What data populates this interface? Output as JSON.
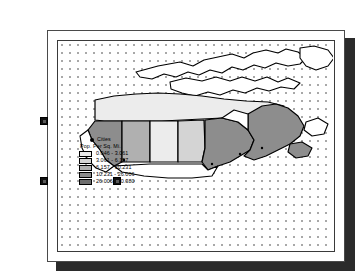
{
  "document": {
    "title": "",
    "type": "map-layout-page"
  },
  "canvas": {
    "grid": "dotted",
    "grid_spacing_px": 8,
    "grid_dot_color": "#a8a8a8",
    "background": "#ffffff"
  },
  "map": {
    "name": "canada-population-density",
    "region": "Canada and northern United States",
    "outline_color": "#000000",
    "fills": {
      "class1": "#ececec",
      "class2": "#d4d4d4",
      "class3": "#b0b0b0",
      "class4": "#8d8d8d",
      "class5": "#6e6e6e",
      "unclassed": "#ffffff"
    },
    "regions": [
      {
        "name": "northern-territories",
        "class": "class1"
      },
      {
        "name": "british-columbia",
        "class": "class4"
      },
      {
        "name": "alberta",
        "class": "class3"
      },
      {
        "name": "saskatchewan",
        "class": "class1"
      },
      {
        "name": "manitoba",
        "class": "class2"
      },
      {
        "name": "ontario",
        "class": "class4"
      },
      {
        "name": "quebec",
        "class": "class4"
      },
      {
        "name": "arctic-islands",
        "class": "unclassed"
      }
    ]
  },
  "legend": {
    "cities_label": "Cities",
    "title": "Pop. Per Sq. Mi.",
    "classes": [
      {
        "label": "0.046 - 3.061",
        "color": "#ececec"
      },
      {
        "label": "3.061 - 6.157",
        "color": "#d4d4d4"
      },
      {
        "label": "6.157 - 10.231",
        "color": "#b0b0b0"
      },
      {
        "label": "10.231 - 26.006",
        "color": "#8d8d8d"
      },
      {
        "label": "26.006 - 40.380",
        "color": "#6e6e6e"
      }
    ]
  },
  "selection": {
    "handle_color": "#111111",
    "handles": [
      {
        "name": "handle-top-left",
        "x": 40,
        "y": 117
      },
      {
        "name": "handle-bottom-left",
        "x": 40,
        "y": 177
      },
      {
        "name": "handle-bottom-right",
        "x": 113,
        "y": 177
      }
    ]
  }
}
